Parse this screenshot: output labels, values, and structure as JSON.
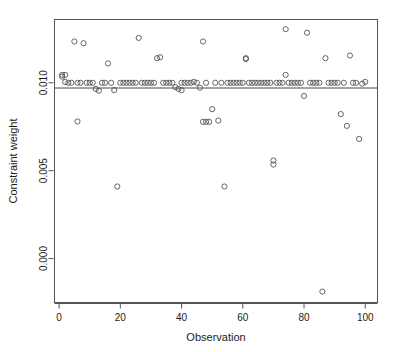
{
  "chart_data": {
    "type": "scatter",
    "title": "",
    "xlabel": "Observation",
    "ylabel": "Constraint weight",
    "xlim": [
      -1.5,
      104
    ],
    "ylim": [
      -0.0025,
      0.0136
    ],
    "grid": false,
    "legend": "none",
    "xticks": [
      0,
      20,
      40,
      60,
      80,
      100
    ],
    "xtick_labels": [
      "0",
      "20",
      "40",
      "60",
      "80",
      "100"
    ],
    "yticks": [
      0.0,
      0.005,
      0.01
    ],
    "ytick_labels": [
      "0.000",
      "0.005",
      "0.010"
    ],
    "marker": "open-circle",
    "marker_color": "#555555",
    "marker_radius_px": 2.6,
    "reference_line": {
      "orientation": "horizontal",
      "y": 0.0097,
      "color": "#4d4d4d",
      "width_px": 1.1
    },
    "x": [
      1,
      1,
      2,
      2,
      3,
      4,
      5,
      6,
      6,
      7,
      8,
      9,
      10,
      11,
      12,
      13,
      14,
      15,
      16,
      17,
      18,
      19,
      20,
      21,
      22,
      23,
      24,
      25,
      26,
      27,
      28,
      29,
      30,
      31,
      32,
      33,
      34,
      35,
      36,
      37,
      38,
      39,
      40,
      40,
      41,
      42,
      43,
      44,
      45,
      46,
      47,
      47,
      48,
      48,
      49,
      50,
      51,
      52,
      53,
      54,
      55,
      56,
      57,
      58,
      59,
      60,
      61,
      61,
      62,
      63,
      64,
      65,
      66,
      67,
      68,
      69,
      70,
      70,
      71,
      72,
      73,
      74,
      74,
      75,
      76,
      77,
      78,
      79,
      80,
      81,
      82,
      83,
      84,
      85,
      86,
      87,
      88,
      89,
      90,
      91,
      92,
      93,
      94,
      95,
      96,
      97,
      98,
      99,
      100
    ],
    "y": [
      0.01045,
      0.01035,
      0.01005,
      0.01045,
      0.01,
      0.01,
      0.01235,
      0.0078,
      0.01,
      0.01,
      0.01225,
      0.01,
      0.01,
      0.01,
      0.00965,
      0.00955,
      0.01,
      0.01,
      0.0111,
      0.01,
      0.00958,
      0.0041,
      0.01,
      0.01,
      0.01,
      0.01,
      0.01,
      0.01,
      0.01255,
      0.01,
      0.01,
      0.01,
      0.01,
      0.01,
      0.0114,
      0.01145,
      0.01,
      0.01,
      0.01,
      0.01,
      0.00975,
      0.00965,
      0.00958,
      0.01,
      0.01,
      0.01,
      0.01,
      0.01005,
      0.01,
      0.00972,
      0.01235,
      0.00778,
      0.00778,
      0.01,
      0.00778,
      0.0085,
      0.01,
      0.00785,
      0.01,
      0.0041,
      0.01,
      0.01,
      0.01,
      0.01,
      0.01,
      0.01,
      0.01135,
      0.0114,
      0.01,
      0.01,
      0.01,
      0.01,
      0.01,
      0.01,
      0.01,
      0.01,
      0.00558,
      0.00535,
      0.01,
      0.01,
      0.01,
      0.01305,
      0.01045,
      0.01,
      0.01,
      0.01,
      0.01,
      0.01,
      0.00925,
      0.01285,
      0.01,
      0.01,
      0.01,
      0.01,
      -0.00188,
      0.0114,
      0.01,
      0.01,
      0.01,
      0.01,
      0.00822,
      0.01,
      0.00755,
      0.01155,
      0.01,
      0.01,
      0.0068,
      0.00995,
      0.01005
    ]
  }
}
